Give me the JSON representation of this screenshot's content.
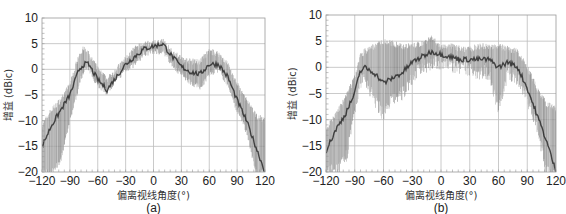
{
  "chart_data": [
    {
      "type": "area",
      "panel_label": "(a)",
      "title": "",
      "xlabel": "偏离视线角度(°)",
      "ylabel": "增益 (dBic)",
      "xlim": [
        -120,
        120
      ],
      "ylim": [
        -20,
        10
      ],
      "xticks": [
        -120,
        -90,
        -60,
        -30,
        0,
        30,
        60,
        90,
        120
      ],
      "xtick_labels": [
        "−120",
        "−90",
        "−60",
        "−30",
        "0",
        "30",
        "60",
        "90",
        "120"
      ],
      "yticks": [
        10,
        5,
        0,
        -5,
        -10,
        -15,
        -20
      ],
      "ytick_labels": [
        "10",
        "5",
        "0",
        "−5",
        "−10",
        "−15",
        "−20"
      ],
      "grid": true,
      "series": [
        {
          "name": "gain-envelope-upper",
          "x": [
            -120,
            -110,
            -100,
            -90,
            -80,
            -75,
            -70,
            -60,
            -50,
            -40,
            -30,
            -20,
            -10,
            0,
            10,
            20,
            30,
            40,
            50,
            60,
            70,
            80,
            90,
            100,
            110,
            120
          ],
          "values": [
            -11,
            -8,
            -6,
            -3,
            3,
            4,
            3,
            0,
            -2,
            0,
            2,
            4,
            5,
            5,
            5.5,
            3.5,
            2,
            1.5,
            1.5,
            3.5,
            3,
            1,
            -3,
            -6,
            -9,
            -10
          ]
        },
        {
          "name": "gain-envelope-lower",
          "x": [
            -120,
            -110,
            -100,
            -90,
            -80,
            -75,
            -70,
            -60,
            -50,
            -40,
            -30,
            -20,
            -10,
            0,
            10,
            20,
            30,
            40,
            50,
            60,
            70,
            80,
            90,
            100,
            110,
            120
          ],
          "values": [
            -20,
            -20,
            -18,
            -10,
            -3,
            0,
            0,
            -3,
            -4.5,
            -2,
            0,
            1,
            3,
            3.5,
            3.5,
            1,
            -1,
            -2.5,
            -3.5,
            -1,
            0,
            -3,
            -8,
            -12,
            -20,
            -20
          ]
        },
        {
          "name": "gain-dark-trace",
          "x": [
            -120,
            -110,
            -100,
            -90,
            -80,
            -75,
            -70,
            -60,
            -50,
            -40,
            -30,
            -20,
            -10,
            0,
            10,
            20,
            30,
            40,
            50,
            60,
            70,
            80,
            90,
            100,
            110,
            120
          ],
          "values": [
            -15,
            -11,
            -8,
            -5,
            0,
            1,
            1,
            -2,
            -4,
            -1.5,
            1,
            2.5,
            4,
            4.5,
            5,
            2.5,
            0.5,
            -0.5,
            -1,
            1,
            1,
            -1.5,
            -6,
            -10,
            -15,
            -20
          ]
        }
      ]
    },
    {
      "type": "area",
      "panel_label": "(b)",
      "title": "",
      "xlabel": "偏离视线角度(°)",
      "ylabel": "增益 (dBic)",
      "xlim": [
        -120,
        120
      ],
      "ylim": [
        -20,
        10
      ],
      "xticks": [
        -120,
        -90,
        -60,
        -30,
        0,
        30,
        60,
        90,
        120
      ],
      "xtick_labels": [
        "−120",
        "−90",
        "−60",
        "−30",
        "0",
        "30",
        "60",
        "90",
        "120"
      ],
      "yticks": [
        10,
        5,
        0,
        -5,
        -10,
        -15,
        -20
      ],
      "ytick_labels": [
        "10",
        "5",
        "0",
        "−5",
        "−10",
        "−15",
        "−20"
      ],
      "grid": true,
      "series": [
        {
          "name": "gain-envelope-upper",
          "x": [
            -120,
            -110,
            -100,
            -90,
            -85,
            -80,
            -70,
            -60,
            -50,
            -40,
            -30,
            -20,
            -10,
            0,
            10,
            20,
            30,
            40,
            50,
            60,
            70,
            80,
            90,
            100,
            110,
            120
          ],
          "values": [
            -12,
            -9,
            -6,
            -2,
            2,
            3,
            4,
            5,
            4.5,
            4,
            4,
            4.5,
            5.5,
            4,
            4,
            3.5,
            3.5,
            4,
            4,
            4,
            3.5,
            3,
            0,
            -4,
            -7,
            -8
          ]
        },
        {
          "name": "gain-envelope-lower",
          "x": [
            -120,
            -110,
            -100,
            -90,
            -85,
            -80,
            -70,
            -60,
            -50,
            -40,
            -30,
            -20,
            -10,
            0,
            10,
            20,
            30,
            40,
            50,
            60,
            70,
            80,
            90,
            100,
            110,
            120
          ],
          "values": [
            -20,
            -20,
            -18,
            -9,
            -3,
            -2,
            -6,
            -9,
            -6,
            -5,
            -2,
            0,
            1,
            1,
            0.5,
            0,
            -0.5,
            -1,
            -1,
            -8,
            -1,
            -2,
            -6,
            -11,
            -20,
            -20
          ]
        },
        {
          "name": "gain-dark-trace",
          "x": [
            -120,
            -110,
            -100,
            -90,
            -85,
            -80,
            -70,
            -60,
            -50,
            -40,
            -30,
            -20,
            -10,
            0,
            10,
            20,
            30,
            40,
            50,
            60,
            70,
            80,
            90,
            100,
            110,
            120
          ],
          "values": [
            -16,
            -12,
            -9,
            -5,
            -1,
            0,
            -1,
            -3,
            -2,
            -1,
            1,
            2,
            3,
            2.5,
            2,
            1.5,
            1.5,
            1.5,
            1.5,
            0,
            1,
            0,
            -4,
            -9,
            -14,
            -20
          ]
        }
      ]
    }
  ]
}
